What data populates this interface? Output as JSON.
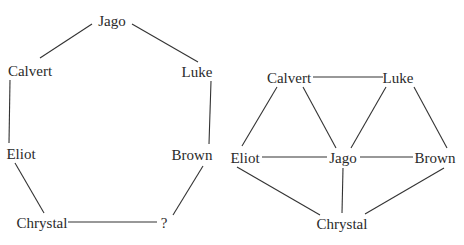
{
  "diagrams": [
    {
      "name": "cycle-graph",
      "nodes": [
        {
          "id": "jago",
          "label": "Jago",
          "x": 112,
          "y": 26
        },
        {
          "id": "calvert",
          "label": "Calvert",
          "x": 30,
          "y": 76
        },
        {
          "id": "luke",
          "label": "Luke",
          "x": 197,
          "y": 77
        },
        {
          "id": "eliot",
          "label": "Eliot",
          "x": 21,
          "y": 159
        },
        {
          "id": "brown",
          "label": "Brown",
          "x": 192,
          "y": 160
        },
        {
          "id": "chrystal",
          "label": "Chrystal",
          "x": 42,
          "y": 228
        },
        {
          "id": "unknown",
          "label": "?",
          "x": 164,
          "y": 228
        }
      ],
      "edges": [
        {
          "from": "jago",
          "to": "calvert",
          "x1": 92,
          "y1": 24,
          "x2": 40,
          "y2": 58
        },
        {
          "from": "jago",
          "to": "luke",
          "x1": 132,
          "y1": 24,
          "x2": 198,
          "y2": 62
        },
        {
          "from": "calvert",
          "to": "eliot",
          "x1": 10,
          "y1": 80,
          "x2": 9,
          "y2": 143
        },
        {
          "from": "luke",
          "to": "brown",
          "x1": 211,
          "y1": 81,
          "x2": 209,
          "y2": 144
        },
        {
          "from": "eliot",
          "to": "chrystal",
          "x1": 15,
          "y1": 163,
          "x2": 44,
          "y2": 213
        },
        {
          "from": "brown",
          "to": "unknown",
          "x1": 203,
          "y1": 166,
          "x2": 173,
          "y2": 215
        },
        {
          "from": "chrystal",
          "to": "unknown",
          "x1": 68,
          "y1": 222,
          "x2": 157,
          "y2": 222
        }
      ]
    },
    {
      "name": "network-graph",
      "nodes": [
        {
          "id": "calvert",
          "label": "Calvert",
          "x": 289,
          "y": 83
        },
        {
          "id": "luke",
          "label": "Luke",
          "x": 398,
          "y": 83
        },
        {
          "id": "eliot",
          "label": "Eliot",
          "x": 245,
          "y": 163
        },
        {
          "id": "jago",
          "label": "Jago",
          "x": 343,
          "y": 163
        },
        {
          "id": "brown",
          "label": "Brown",
          "x": 435,
          "y": 163
        },
        {
          "id": "chrystal",
          "label": "Chrystal",
          "x": 342,
          "y": 229
        }
      ],
      "edges": [
        {
          "from": "calvert",
          "to": "luke",
          "x1": 313,
          "y1": 77,
          "x2": 383,
          "y2": 77
        },
        {
          "from": "calvert",
          "to": "eliot",
          "x1": 277,
          "y1": 87,
          "x2": 242,
          "y2": 146
        },
        {
          "from": "calvert",
          "to": "jago",
          "x1": 303,
          "y1": 87,
          "x2": 336,
          "y2": 148
        },
        {
          "from": "luke",
          "to": "jago",
          "x1": 386,
          "y1": 87,
          "x2": 351,
          "y2": 148
        },
        {
          "from": "luke",
          "to": "brown",
          "x1": 414,
          "y1": 87,
          "x2": 447,
          "y2": 148
        },
        {
          "from": "eliot",
          "to": "jago",
          "x1": 262,
          "y1": 157,
          "x2": 327,
          "y2": 157
        },
        {
          "from": "jago",
          "to": "brown",
          "x1": 360,
          "y1": 157,
          "x2": 413,
          "y2": 157
        },
        {
          "from": "eliot",
          "to": "chrystal",
          "x1": 237,
          "y1": 167,
          "x2": 320,
          "y2": 215
        },
        {
          "from": "jago",
          "to": "chrystal",
          "x1": 343,
          "y1": 168,
          "x2": 342,
          "y2": 213
        },
        {
          "from": "brown",
          "to": "chrystal",
          "x1": 444,
          "y1": 168,
          "x2": 365,
          "y2": 214
        }
      ]
    }
  ]
}
